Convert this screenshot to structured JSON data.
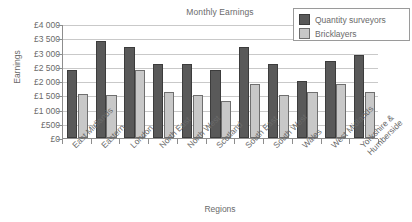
{
  "chart_data": {
    "type": "bar",
    "title": "Monthly Earnings",
    "xlabel": "Regions",
    "ylabel": "Earnings",
    "categories": [
      "East Midlands",
      "Eastern",
      "London",
      "North East",
      "North West",
      "Scotland",
      "South East",
      "South West",
      "Wales",
      "West Midlands",
      "Yorkshire & Humberside"
    ],
    "series": [
      {
        "name": "Quantity surveyors",
        "color": "#595959",
        "values": [
          2400,
          3400,
          3200,
          2600,
          2600,
          2400,
          3200,
          2600,
          2000,
          2700,
          2900
        ]
      },
      {
        "name": "Bricklayers",
        "color": "#c8c8c8",
        "values": [
          1550,
          1500,
          2400,
          1600,
          1500,
          1300,
          1900,
          1500,
          1600,
          1900,
          1600
        ]
      }
    ],
    "ylim": [
      0,
      4000
    ],
    "ytick_values": [
      0,
      500,
      1000,
      1500,
      2000,
      2500,
      3000,
      3500,
      4000
    ],
    "ytick_labels": [
      "£0",
      "£500",
      "£1 000",
      "£1 500",
      "£2 000",
      "£2 500",
      "£3 000",
      "£3 500",
      "£4 000"
    ],
    "grid": true,
    "legend_position": "top-right"
  }
}
